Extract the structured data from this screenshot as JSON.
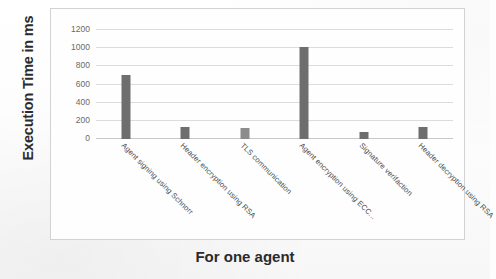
{
  "chart_data": {
    "type": "bar",
    "title": "",
    "xlabel": "For one agent",
    "ylabel": "Execution Time in ms",
    "ylim": [
      0,
      1200
    ],
    "yticks": [
      0,
      200,
      400,
      600,
      800,
      1000,
      1200
    ],
    "ytick_labels": [
      "0",
      "200",
      "400",
      "600",
      "800",
      "1000",
      "1200"
    ],
    "grid": true,
    "legend": false,
    "bar_color": "#6e6e6e",
    "categories": [
      "Agent signing using Schnorr",
      "Header encryption  using RSA",
      "TLS communication",
      "Agent encryption using ECC...",
      "Signature verifaction",
      "Header decryption using RSA"
    ],
    "values": [
      700,
      130,
      120,
      1010,
      80,
      130
    ]
  }
}
